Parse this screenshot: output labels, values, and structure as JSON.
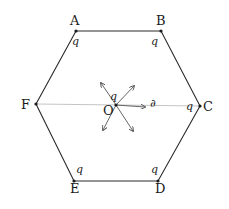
{
  "diagram": {
    "type": "regular-hexagon-charges",
    "vertices": [
      {
        "label": "A",
        "x": 76,
        "y": 31,
        "charge": "q",
        "lx": 70,
        "ly": 25,
        "qx": 72,
        "qy": 45
      },
      {
        "label": "B",
        "x": 161,
        "y": 31,
        "charge": "q",
        "lx": 156,
        "ly": 25,
        "qx": 151,
        "qy": 45
      },
      {
        "label": "C",
        "x": 200,
        "y": 106,
        "charge": "q",
        "lx": 203,
        "ly": 111,
        "qx": 186,
        "qy": 110
      },
      {
        "label": "D",
        "x": 158,
        "y": 181,
        "charge": "q",
        "lx": 155,
        "ly": 193,
        "qx": 151,
        "qy": 173
      },
      {
        "label": "E",
        "x": 74,
        "y": 181,
        "charge": "q",
        "lx": 70,
        "ly": 193,
        "qx": 76,
        "qy": 173
      },
      {
        "label": "F",
        "x": 36,
        "y": 104,
        "charge": "",
        "lx": 21,
        "ly": 109
      }
    ],
    "center": {
      "label": "O",
      "x": 116,
      "y": 105,
      "lx": 103,
      "ly": 115,
      "charge_label": "q",
      "qx": 110,
      "qy": 100
    },
    "center_annotation": "∂",
    "arrows": [
      {
        "name": "arrow-to-c",
        "x2": 145,
        "y2": 107
      },
      {
        "name": "arrow-up-left",
        "x2": 101,
        "y2": 83
      },
      {
        "name": "arrow-up-right",
        "x2": 134,
        "y2": 86
      },
      {
        "name": "arrow-down-left",
        "x2": 103,
        "y2": 130
      },
      {
        "name": "arrow-down-right",
        "x2": 133,
        "y2": 131
      }
    ],
    "colors": {
      "line": "#2a2a2a",
      "axis": "#b5b5b5",
      "arrow": "#555555"
    }
  }
}
